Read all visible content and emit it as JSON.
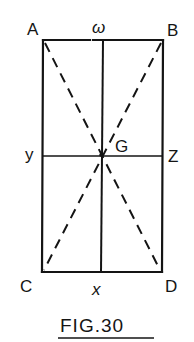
{
  "figure": {
    "caption": "FIG.30",
    "ink_color": "#141414",
    "background_color": "#ffffff"
  },
  "points": {
    "A": {
      "label": "A",
      "role": "top-left corner"
    },
    "B": {
      "label": "B",
      "role": "top-right corner"
    },
    "C": {
      "label": "C",
      "role": "bottom-left corner"
    },
    "D": {
      "label": "D",
      "role": "bottom-right corner"
    },
    "G": {
      "label": "G",
      "role": "centre (intersection of diagonals)"
    },
    "w": {
      "label": "ω",
      "role": "midpoint of AB"
    },
    "x": {
      "label": "x",
      "role": "midpoint of CD"
    },
    "y": {
      "label": "y",
      "role": "midpoint of AC"
    },
    "z": {
      "label": "Z",
      "role": "midpoint of BD"
    }
  },
  "lines": [
    {
      "from": "A",
      "to": "B",
      "style": "solid"
    },
    {
      "from": "B",
      "to": "D",
      "style": "solid"
    },
    {
      "from": "D",
      "to": "C",
      "style": "solid"
    },
    {
      "from": "C",
      "to": "A",
      "style": "solid"
    },
    {
      "from": "w",
      "to": "x",
      "style": "solid"
    },
    {
      "from": "y",
      "to": "z",
      "style": "solid"
    },
    {
      "from": "A",
      "to": "D",
      "style": "dashed"
    },
    {
      "from": "B",
      "to": "C",
      "style": "dashed"
    }
  ]
}
